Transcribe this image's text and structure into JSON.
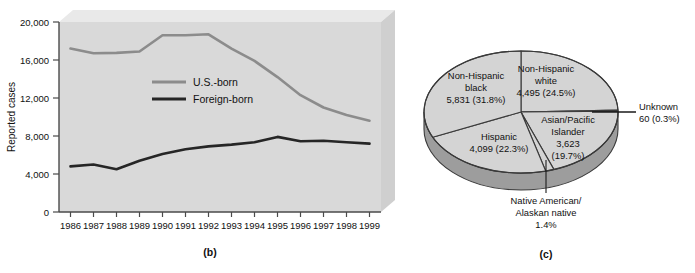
{
  "figure": {
    "panel_b_caption": "(b)",
    "panel_c_caption": "(c)"
  },
  "chart_data": [
    {
      "type": "line",
      "panel": "(b)",
      "title": "",
      "xlabel": "",
      "ylabel": "Reported cases",
      "categories": [
        "1986",
        "1987",
        "1988",
        "1989",
        "1990",
        "1991",
        "1992",
        "1993",
        "1994",
        "1995",
        "1996",
        "1997",
        "1998",
        "1999"
      ],
      "ylim": [
        0,
        20000
      ],
      "yticks": [
        "0",
        "4,000",
        "8,000",
        "12,000",
        "16,000",
        "20,000"
      ],
      "ytick_values": [
        0,
        4000,
        8000,
        12000,
        16000,
        20000
      ],
      "grid": false,
      "legend_position": "center-left",
      "series": [
        {
          "name": "U.S.-born",
          "color": "#8c8c8c",
          "values": [
            17200,
            16700,
            16750,
            16900,
            18600,
            18600,
            18700,
            17200,
            15900,
            14200,
            12300,
            11000,
            10200,
            9600
          ]
        },
        {
          "name": "Foreign-born",
          "color": "#262626",
          "values": [
            4800,
            5000,
            4500,
            5400,
            6100,
            6600,
            6900,
            7100,
            7350,
            7900,
            7450,
            7500,
            7350,
            7200
          ]
        }
      ]
    },
    {
      "type": "pie",
      "panel": "(c)",
      "title": "",
      "start_angle_deg": 0,
      "direction": "clockwise",
      "three_d": true,
      "slice_color": "#d4d4d4",
      "side_color": "#9d9d9d",
      "slices": [
        {
          "name": "Non-Hispanic white",
          "value": 4495,
          "percent": 24.5,
          "label_lines": [
            "Non-Hispanic",
            "white",
            "4,495 (24.5%)"
          ],
          "label_placement": "inside"
        },
        {
          "name": "Unknown",
          "value": 60,
          "percent": 0.3,
          "label_lines": [
            "Unknown",
            "60 (0.3%)"
          ],
          "label_placement": "callout-right"
        },
        {
          "name": "Asian/Pacific Islander",
          "value": 3623,
          "percent": 19.7,
          "label_lines": [
            "Asian/Pacific",
            "Islander",
            "3,623",
            "(19.7%)"
          ],
          "label_placement": "inside"
        },
        {
          "name": "Native American/Alaskan native",
          "value": null,
          "percent": 1.4,
          "label_lines": [
            "Native American/",
            "Alaskan native",
            "1.4%"
          ],
          "label_placement": "callout-bottom"
        },
        {
          "name": "Hispanic",
          "value": 4099,
          "percent": 22.3,
          "label_lines": [
            "Hispanic",
            "4,099 (22.3%)"
          ],
          "label_placement": "inside"
        },
        {
          "name": "Non-Hispanic black",
          "value": 5831,
          "percent": 31.8,
          "label_lines": [
            "Non-Hispanic",
            "black",
            "5,831 (31.8%)"
          ],
          "label_placement": "inside"
        }
      ]
    }
  ],
  "line_chart": {
    "ylabel": "Reported cases",
    "yticks": [
      "20,000",
      "16,000",
      "12,000",
      "8,000",
      "4,000",
      "0"
    ],
    "xticks": [
      "1986",
      "1987",
      "1988",
      "1989",
      "1990",
      "1991",
      "1992",
      "1993",
      "1994",
      "1995",
      "1996",
      "1997",
      "1998",
      "1999"
    ],
    "legend": [
      {
        "label": "U.S.-born",
        "color": "#8c8c8c"
      },
      {
        "label": "Foreign-born",
        "color": "#262626"
      }
    ],
    "plot_bg": "#d9d9d9",
    "plot_top_face": "#e8e8e8",
    "plot_side_face": "#cfcfcf"
  },
  "pie_chart": {
    "labels": {
      "nh_white_l1": "Non-Hispanic",
      "nh_white_l2": "white",
      "nh_white_l3": "4,495 (24.5%)",
      "nh_black_l1": "Non-Hispanic",
      "nh_black_l2": "black",
      "nh_black_l3": "5,831 (31.8%)",
      "hispanic_l1": "Hispanic",
      "hispanic_l2": "4,099 (22.3%)",
      "asian_l1": "Asian/Pacific",
      "asian_l2": "Islander",
      "asian_l3": "3,623",
      "asian_l4": "(19.7%)",
      "unknown_l1": "Unknown",
      "unknown_l2": "60 (0.3%)",
      "native_l1": "Native American/",
      "native_l2": "Alaskan native",
      "native_l3": "1.4%"
    }
  }
}
